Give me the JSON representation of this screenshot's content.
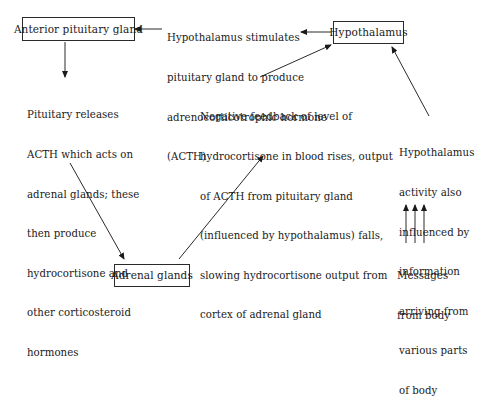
{
  "diagram": {
    "nodes": {
      "anterior_pituitary": "Anterior pituitary gland",
      "hypothalamus": "Hypothalamus",
      "adrenal_glands": "Adrenal glands"
    },
    "annotations": {
      "hypothalamus_stimulates": [
        "Hypothalamus stimulates",
        "pituitary gland to produce",
        "adrenocorticotrophic hormone",
        "(ACTH)"
      ],
      "pituitary_releases": [
        "Pituitary releases",
        "ACTH which acts on",
        "adrenal glands; these",
        "then produce",
        "hydrocortisone and",
        "other corticosteroid",
        "hormones"
      ],
      "negative_feedback": [
        "Negative feedback of level of",
        "hydrocortisone in blood rises, output",
        "of ACTH from pituitary gland",
        "(influenced by hypothalamus) falls,",
        "slowing hydrocortisone output from",
        "cortex of adrenal gland"
      ],
      "hypothalamus_activity": [
        "Hypothalamus",
        "activity also",
        "influenced by",
        "information",
        "arriving from",
        "various parts",
        "of body"
      ],
      "messages_from_body": [
        "Messages",
        "from body"
      ]
    },
    "arrows": [
      {
        "from": "hypothalamus",
        "to": "hypothalamus_stimulates",
        "icon": "arrow-left-icon"
      },
      {
        "from": "hypothalamus_stimulates",
        "to": "anterior_pituitary",
        "icon": "arrow-left-icon"
      },
      {
        "from": "anterior_pituitary",
        "to": "pituitary_releases",
        "icon": "arrow-down-icon"
      },
      {
        "from": "pituitary_releases",
        "to": "adrenal_glands",
        "icon": "arrow-down-right-icon"
      },
      {
        "from": "adrenal_glands",
        "to": "negative_feedback",
        "icon": "arrow-up-right-icon"
      },
      {
        "from": "negative_feedback",
        "to": "hypothalamus",
        "icon": "arrow-up-right-icon"
      },
      {
        "from": "hypothalamus_activity",
        "to": "hypothalamus",
        "icon": "arrow-up-left-icon"
      },
      {
        "from": "messages_from_body",
        "to": "hypothalamus_activity",
        "icon": "arrow-up-icon",
        "count": 3
      }
    ]
  }
}
